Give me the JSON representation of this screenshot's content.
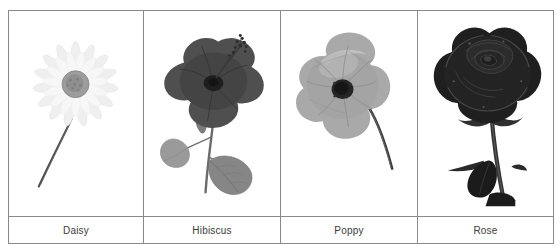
{
  "table": {
    "caption_row_label": "flower names",
    "columns": [
      {
        "id": "daisy",
        "label": "Daisy",
        "image_name": "daisy-photo",
        "image_alt": "grayscale photograph of a daisy flower with white radiating petals, gray disc center and a thin curved stem",
        "palette": {
          "petal": "#f4f4f4",
          "petal_shade": "#e3e3e3",
          "center": "#9a9a9a",
          "center_dark": "#7e7e7e",
          "stem": "#4a4a4a"
        }
      },
      {
        "id": "hibiscus",
        "label": "Hibiscus",
        "image_name": "hibiscus-photo",
        "image_alt": "grayscale photograph of a hibiscus flower, dark petals with a long stamen column and two leaves on the stem",
        "palette": {
          "petal": "#555555",
          "petal_shade": "#3b3b3b",
          "throat": "#262626",
          "leaf": "#8d8d8d",
          "leaf_dark": "#6f6f6f",
          "stem": "#5e5e5e",
          "stamen": "#2b2b2b"
        }
      },
      {
        "id": "poppy",
        "label": "Poppy",
        "image_name": "poppy-photo",
        "image_alt": "grayscale photograph of a poppy flower with crinkled mid gray petals, very dark center and a curved stem with a bud",
        "palette": {
          "petal": "#a8a8a8",
          "petal_shade": "#8e8e8e",
          "petal_light": "#c2c2c2",
          "center": "#1f1f1f",
          "stem": "#3d3d3d"
        }
      },
      {
        "id": "rose",
        "label": "Rose",
        "image_name": "rose-photo",
        "image_alt": "grayscale photograph of a very dark rose in full bloom with spiralled petals, a thick stem and a dark leaf",
        "palette": {
          "petal": "#2a2a2a",
          "petal_shade": "#101010",
          "petal_light": "#4a4a4a",
          "stem": "#3a3a3a",
          "leaf": "#1a1a1a"
        }
      }
    ]
  },
  "style": {
    "border_color": "#8a8a8a",
    "background": "#ffffff",
    "label_color": "#3a3a3a"
  }
}
